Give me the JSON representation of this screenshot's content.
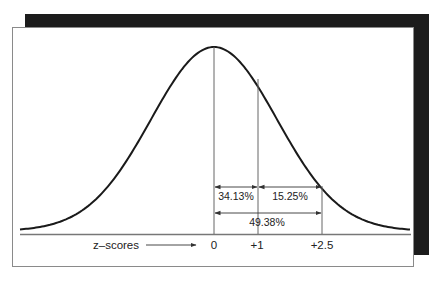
{
  "figure": {
    "axis_label": "z–scores",
    "ticks": [
      {
        "label": "0",
        "z": 0
      },
      {
        "label": "+1",
        "z": 1
      },
      {
        "label": "+2.5",
        "z": 2.5
      }
    ],
    "areas": [
      {
        "label": "34.13%",
        "from": "0",
        "to": "+1"
      },
      {
        "label": "15.25%",
        "from": "+1",
        "to": "+2.5"
      },
      {
        "label": "49.38%",
        "from": "0",
        "to": "+2.5"
      }
    ],
    "colors": {
      "curve": "#1a1a1a",
      "lines": "#666666",
      "shadow": "#1c1c1c",
      "panel": "#ffffff"
    }
  }
}
